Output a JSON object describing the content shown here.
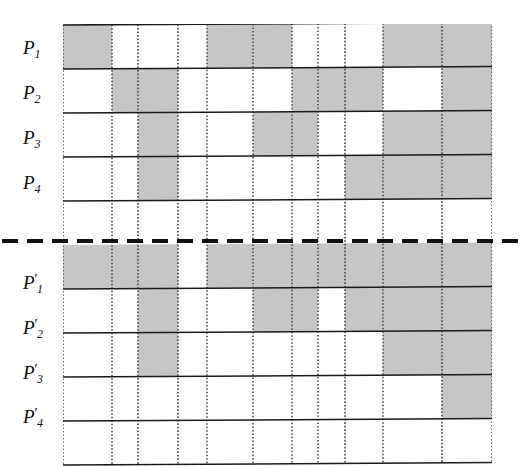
{
  "figure": {
    "type": "binary-occupancy-grid-diagram",
    "colors": {
      "shaded_cell": "#c6c6c6",
      "empty_cell": "#ffffff",
      "solid_rule": "#1a1a1a",
      "dotted_rule": "#4d4d4d",
      "divider": "#111111",
      "label_text": "#0d0d0d"
    },
    "grid": {
      "columns": 11,
      "rows_per_group": 5,
      "column_x": [
        63,
        112,
        138,
        178,
        207,
        253,
        292,
        318,
        345,
        383,
        442,
        492
      ],
      "row_height": 44
    },
    "divider": {
      "style": "dashed",
      "dash_length": 16,
      "gap_length": 9,
      "thickness": 4
    }
  },
  "labels": {
    "top": [
      {
        "base": "P",
        "sub": "1",
        "prime": ""
      },
      {
        "base": "P",
        "sub": "2",
        "prime": ""
      },
      {
        "base": "P",
        "sub": "3",
        "prime": ""
      },
      {
        "base": "P",
        "sub": "4",
        "prime": ""
      }
    ],
    "bottom": [
      {
        "base": "P",
        "sub": "1",
        "prime": "′"
      },
      {
        "base": "P",
        "sub": "2",
        "prime": "′"
      },
      {
        "base": "P",
        "sub": "3",
        "prime": "′"
      },
      {
        "base": "P",
        "sub": "4",
        "prime": "′"
      }
    ]
  },
  "chart_data": {
    "type": "heatmap",
    "title": "",
    "xlabel": "",
    "ylabel": "",
    "legend": [],
    "categories": [
      "c1",
      "c2",
      "c3",
      "c4",
      "c5",
      "c6",
      "c7",
      "c8",
      "c9",
      "c10",
      "c11"
    ],
    "row_labels": [
      "P1",
      "P2",
      "P3",
      "P4",
      "",
      "P1'",
      "P2'",
      "P3'",
      "P4'",
      ""
    ],
    "value_map": {
      "0": "empty",
      "1": "shaded"
    },
    "series": [
      {
        "name": "P1",
        "group": "top",
        "values": [
          1,
          0,
          0,
          0,
          1,
          1,
          0,
          0,
          0,
          1,
          1
        ]
      },
      {
        "name": "P2",
        "group": "top",
        "values": [
          0,
          1,
          1,
          0,
          0,
          0,
          1,
          1,
          1,
          0,
          1
        ]
      },
      {
        "name": "P3",
        "group": "top",
        "values": [
          0,
          0,
          1,
          0,
          0,
          1,
          1,
          0,
          0,
          1,
          1
        ]
      },
      {
        "name": "P4",
        "group": "top",
        "values": [
          0,
          0,
          1,
          0,
          0,
          0,
          0,
          0,
          1,
          1,
          1
        ]
      },
      {
        "name": "",
        "group": "top",
        "values": [
          0,
          0,
          0,
          0,
          0,
          0,
          0,
          0,
          0,
          0,
          0
        ]
      },
      {
        "name": "P1'",
        "group": "bottom",
        "values": [
          1,
          1,
          1,
          0,
          1,
          1,
          1,
          1,
          1,
          1,
          1
        ]
      },
      {
        "name": "P2'",
        "group": "bottom",
        "values": [
          0,
          0,
          1,
          0,
          0,
          1,
          1,
          0,
          1,
          1,
          1
        ]
      },
      {
        "name": "P3'",
        "group": "bottom",
        "values": [
          0,
          0,
          1,
          0,
          0,
          0,
          0,
          0,
          0,
          1,
          1
        ]
      },
      {
        "name": "P4'",
        "group": "bottom",
        "values": [
          0,
          0,
          0,
          0,
          0,
          0,
          0,
          0,
          0,
          0,
          1
        ]
      },
      {
        "name": "",
        "group": "bottom",
        "values": [
          0,
          0,
          0,
          0,
          0,
          0,
          0,
          0,
          0,
          0,
          0
        ]
      }
    ]
  }
}
